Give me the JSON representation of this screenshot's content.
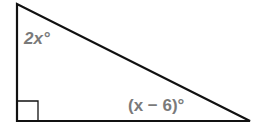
{
  "diagram": {
    "type": "right-triangle",
    "angle_top_left": "2x°",
    "angle_bottom_right": "(x − 6)°",
    "right_angle_marker": "bottom-left",
    "stroke_color": "#111111",
    "label_color": "#7a7a7a"
  }
}
